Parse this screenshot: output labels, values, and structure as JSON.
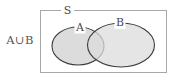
{
  "figure": {
    "name": "venn-diagram-a-union-b",
    "background_color": "#ffffff",
    "width": 172,
    "height": 84
  },
  "expression": {
    "label": "A∪B",
    "color": "#545454"
  },
  "universal_set": {
    "label": "S",
    "border_color": "#a8a8a8",
    "fill_color": "#ffffff",
    "x": 40,
    "y": 10,
    "width": 127,
    "height": 63,
    "label_x": 67,
    "label_y": 10
  },
  "sets": [
    {
      "label": "A",
      "cx": 78,
      "cy": 46,
      "rx": 26,
      "ry": 19,
      "fill_color": "#dcdcdc",
      "stroke_color": "#3c3c3c",
      "label_x": 80,
      "label_y": 27.5
    },
    {
      "label": "B",
      "cx": 121,
      "cy": 45,
      "rx": 33.5,
      "ry": 22,
      "fill_color": "#dcdcdc",
      "stroke_color": "#3c3c3c",
      "label_x": 120,
      "label_y": 23
    }
  ]
}
